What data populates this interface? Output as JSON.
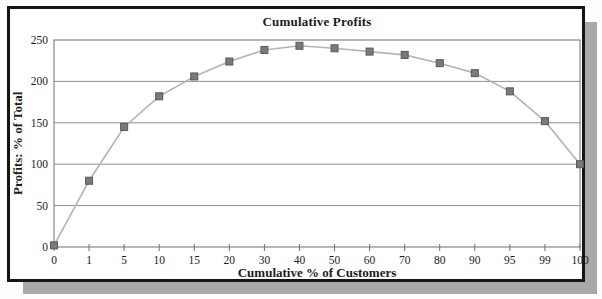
{
  "frame": {
    "background": "#ffffff",
    "border_color": "#141414",
    "shadow_color": "#a9a9a9"
  },
  "chart_data": {
    "type": "line",
    "title": "Cumulative Profits",
    "xlabel": "Cumulative % of Customers",
    "ylabel": "Profits: % of Total",
    "categories": [
      "0",
      "1",
      "5",
      "10",
      "15",
      "20",
      "30",
      "40",
      "50",
      "60",
      "70",
      "80",
      "90",
      "95",
      "99",
      "100"
    ],
    "values": [
      2,
      80,
      145,
      182,
      206,
      224,
      238,
      243,
      240,
      236,
      232,
      222,
      210,
      188,
      152,
      100
    ],
    "ylim": [
      0,
      250
    ],
    "yticks": [
      0,
      50,
      100,
      150,
      200,
      250
    ],
    "grid": true,
    "legend_position": "none",
    "marker": "square",
    "colors": {
      "line": "#b4b4b4",
      "marker_fill": "#7a7a7a",
      "marker_edge": "#585858",
      "gridline": "#8f8f8f",
      "plot_border": "#6e6e6e",
      "tick": "#6e6e6e",
      "text": "#1c1c1c"
    }
  }
}
